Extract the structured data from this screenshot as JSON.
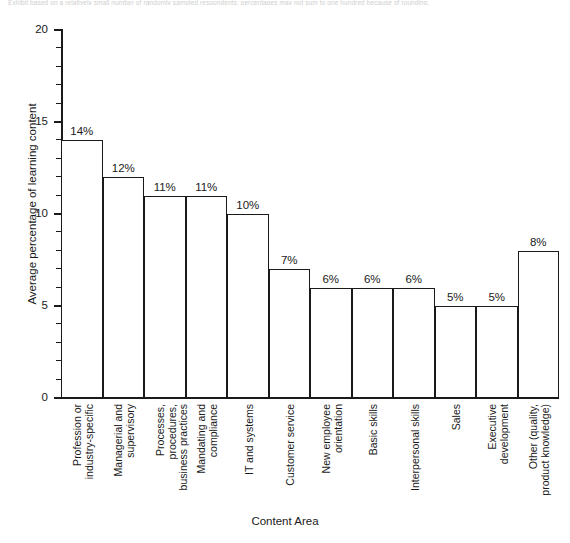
{
  "figure": {
    "top_caption_sliver": "Exhibit based on a relatively small number of randomly sampled respondents; percentages may not sum to one hundred because of rounding."
  },
  "chart_data": {
    "type": "bar",
    "title": "",
    "xlabel": "Content Area",
    "ylabel": "Average percentage of learning content",
    "categories": [
      "Profession or\nindustry-specific",
      "Managerial and\nsupervisory",
      "Processes, procedures,\nbusiness practices",
      "Mandating and\ncompliance",
      "IT and systems",
      "Customer service",
      "New employee\norientation",
      "Basic skills",
      "Interpersonal skills",
      "Sales",
      "Executive\ndevelopment",
      "Other (quality,\nproduct knowledge)"
    ],
    "values": [
      14,
      12,
      11,
      11,
      10,
      7,
      6,
      6,
      6,
      5,
      5,
      8
    ],
    "value_labels": [
      "14%",
      "12%",
      "11%",
      "11%",
      "10%",
      "7%",
      "6%",
      "6%",
      "6%",
      "5%",
      "5%",
      "8%"
    ],
    "ylim": [
      0,
      20
    ],
    "y_major_ticks": [
      0,
      5,
      10,
      15,
      20
    ],
    "y_major_tick_labels": [
      "0",
      "5",
      "10",
      "15",
      "20"
    ],
    "y_minor_tick_step": 1,
    "grid": false,
    "legend": null,
    "bar_style": {
      "fill": "#ffffff",
      "edge": "#1a1a1a",
      "gap": 0
    }
  }
}
